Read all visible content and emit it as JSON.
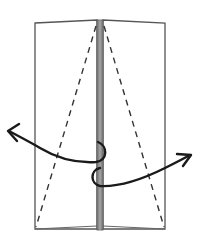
{
  "diagram": {
    "type": "origami-fold-step",
    "colors": {
      "background": "#ffffff",
      "outline": "#555555",
      "center_strip": "#8a8a8a",
      "dash": "#333333",
      "arrow": "#1a1a1a"
    },
    "elements": {
      "left_panel": "left-flap",
      "right_panel": "right-flap",
      "center_strip": "center-crease-strip",
      "left_dashed_line": "valley-fold-line-left",
      "right_dashed_line": "valley-fold-line-right",
      "left_arrow": "open-left-arrow",
      "right_arrow": "open-right-arrow"
    }
  }
}
